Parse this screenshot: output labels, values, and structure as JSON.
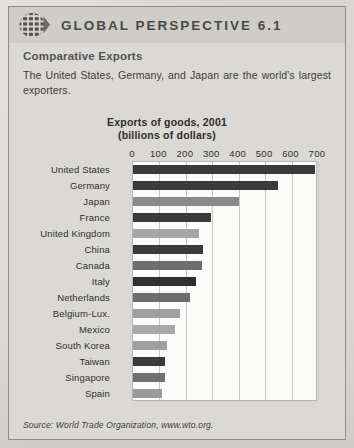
{
  "header": {
    "logo_icon": "globe-grid-icon",
    "title": "GLOBAL PERSPECTIVE 6.1"
  },
  "intro": {
    "heading": "Comparative Exports",
    "body": "The United States, Germany, and Japan are the world's largest exporters."
  },
  "source": {
    "text": "Source: World Trade Organization, www.wto.org."
  },
  "colors": {
    "page_background": "#d9d7d3",
    "frame_background": "#dbd9d5",
    "header_band": "#cfcdc9",
    "plot_background": "#fbfbfa",
    "gridline": "#c9c7c3",
    "bar_dark": "#3a3a3a",
    "bar_medium": "#808080",
    "bar_light": "#a8a8a8",
    "text": "#2f2d2b"
  },
  "chart_data": {
    "type": "bar",
    "orientation": "horizontal",
    "title": "Exports of goods, 2001",
    "subtitle": "(billions of dollars)",
    "xlabel": "",
    "ylabel": "",
    "xlim": [
      0,
      700
    ],
    "xticks": [
      0,
      100,
      200,
      300,
      400,
      500,
      600,
      700
    ],
    "xtick_labels": [
      "0",
      "100",
      "200",
      "300",
      "400",
      "500",
      "600",
      "700"
    ],
    "grid": true,
    "legend": null,
    "categories": [
      "United States",
      "Germany",
      "Japan",
      "France",
      "United Kingdom",
      "China",
      "Canada",
      "Italy",
      "Netherlands",
      "Belgium-Lux.",
      "Mexico",
      "South Korea",
      "Taiwan",
      "Singapore",
      "Spain"
    ],
    "values": [
      690,
      550,
      400,
      295,
      250,
      266,
      260,
      240,
      216,
      178,
      160,
      128,
      122,
      120,
      110
    ],
    "bar_colors": [
      "#3a3a3a",
      "#3a3a3a",
      "#8a8a8a",
      "#3a3a3a",
      "#a6a6a6",
      "#3a3a3a",
      "#6e6e6e",
      "#2f2f2f",
      "#6e6e6e",
      "#a0a0a0",
      "#a8a8a8",
      "#a0a0a0",
      "#3a3a3a",
      "#707070",
      "#9a9a9a"
    ]
  }
}
